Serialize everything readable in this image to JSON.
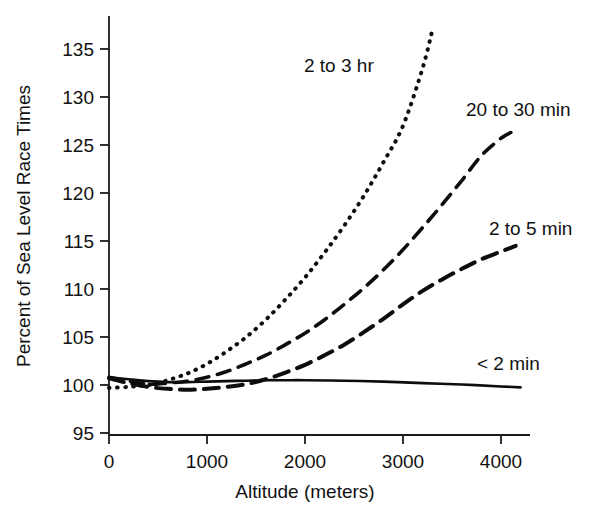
{
  "chart_data": {
    "type": "line",
    "title": "",
    "xlabel": "Altitude (meters)",
    "ylabel": "Percent of Sea Level Race Times",
    "xlim": [
      0,
      4300
    ],
    "ylim": [
      95,
      137.5
    ],
    "xticks": [
      0,
      1000,
      2000,
      3000,
      4000
    ],
    "xticklabels": [
      "0",
      "1000",
      "2000",
      "3000",
      "4000"
    ],
    "yticks": [
      95,
      100,
      105,
      110,
      115,
      120,
      125,
      130,
      135
    ],
    "yticklabels": [
      "95",
      "100",
      "105",
      "110",
      "115",
      "120",
      "125",
      "130",
      "135"
    ],
    "grid": false,
    "legend_position": "inline-annotations",
    "series": [
      {
        "name": "2 to 3 hr",
        "style": "dotted",
        "label_text": "2 to 3 hr",
        "x": [
          0,
          200,
          400,
          500,
          600,
          800,
          1000,
          1200,
          1400,
          1600,
          1800,
          2000,
          2200,
          2400,
          2600,
          2800,
          3000,
          3200,
          3300
        ],
        "y": [
          99.7,
          99.8,
          100.0,
          100.2,
          100.5,
          101.2,
          102.2,
          103.5,
          105.0,
          106.8,
          108.9,
          111.2,
          113.8,
          116.6,
          119.7,
          123.2,
          127.0,
          133.0,
          137.0
        ]
      },
      {
        "name": "20 to 30 min",
        "style": "dashed",
        "label_text": "20 to 30 min",
        "x": [
          0,
          200,
          400,
          500,
          600,
          800,
          1000,
          1200,
          1400,
          1600,
          1800,
          2000,
          2200,
          2400,
          2600,
          2800,
          3000,
          3200,
          3400,
          3600,
          3800,
          4000,
          4100
        ],
        "y": [
          100.8,
          100.4,
          100.1,
          100.1,
          100.2,
          100.4,
          100.8,
          101.4,
          102.2,
          103.1,
          104.2,
          105.4,
          106.8,
          108.4,
          110.1,
          112.0,
          114.1,
          116.4,
          118.8,
          121.3,
          123.9,
          125.7,
          126.3
        ]
      },
      {
        "name": "2 to 5 min",
        "style": "dashed-long",
        "label_text": "2 to 5 min",
        "x": [
          0,
          200,
          400,
          600,
          800,
          1000,
          1200,
          1400,
          1600,
          1800,
          2000,
          2200,
          2400,
          2600,
          2800,
          3000,
          3200,
          3400,
          3600,
          3800,
          4000,
          4150
        ],
        "y": [
          100.7,
          100.2,
          99.8,
          99.6,
          99.5,
          99.6,
          99.8,
          100.1,
          100.6,
          101.3,
          102.1,
          103.1,
          104.2,
          105.5,
          106.9,
          108.4,
          109.8,
          111.0,
          112.1,
          113.1,
          113.9,
          114.5
        ]
      },
      {
        "name": "< 2 min",
        "style": "solid",
        "label_text": "< 2 min",
        "x": [
          0,
          200,
          400,
          600,
          800,
          1000,
          1200,
          1400,
          1600,
          1800,
          2000,
          2400,
          2800,
          3200,
          3600,
          4000,
          4200
        ],
        "y": [
          100.8,
          100.6,
          100.4,
          100.3,
          100.3,
          100.35,
          100.4,
          100.45,
          100.5,
          100.5,
          100.5,
          100.45,
          100.35,
          100.2,
          100.05,
          99.85,
          99.75
        ]
      }
    ],
    "annotations": [
      {
        "text": "2 to 3 hr",
        "x_px": 304,
        "y_px": 72
      },
      {
        "text": "20 to 30 min",
        "x_px": 466,
        "y_px": 116
      },
      {
        "text": "2 to 5 min",
        "x_px": 489,
        "y_px": 235
      },
      {
        "text": "< 2 min",
        "x_px": 477,
        "y_px": 370
      }
    ],
    "colors": {
      "line": "#0d0d0d",
      "axis": "#1a1a1a",
      "background": "#ffffff",
      "text": "#111111"
    }
  }
}
